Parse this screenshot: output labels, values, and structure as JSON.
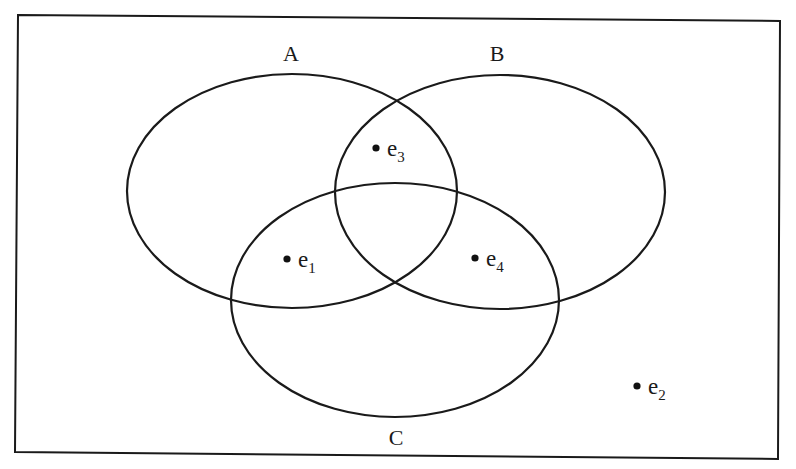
{
  "diagram": {
    "type": "venn",
    "universe": {
      "x1": 17,
      "y1": 15,
      "x2": 779,
      "y2": 457
    },
    "stroke_color": "#1a1a1a",
    "sets": [
      {
        "label": "A",
        "cx": 292,
        "cy": 191,
        "rx": 165,
        "ry": 117,
        "label_x": 291,
        "label_y": 61
      },
      {
        "label": "B",
        "cx": 500,
        "cy": 192,
        "rx": 165,
        "ry": 117,
        "label_x": 497,
        "label_y": 61
      },
      {
        "label": "C",
        "cx": 395,
        "cy": 300,
        "rx": 164,
        "ry": 117,
        "label_x": 396,
        "label_y": 445
      }
    ],
    "elements": [
      {
        "name": "e",
        "sub": "1",
        "x": 287,
        "y": 259,
        "region": "A∩C only"
      },
      {
        "name": "e",
        "sub": "2",
        "x": 637,
        "y": 386,
        "region": "outside all sets"
      },
      {
        "name": "e",
        "sub": "3",
        "x": 376,
        "y": 148,
        "region": "A∩B only"
      },
      {
        "name": "e",
        "sub": "4",
        "x": 475,
        "y": 258,
        "region": "B∩C only"
      }
    ]
  }
}
